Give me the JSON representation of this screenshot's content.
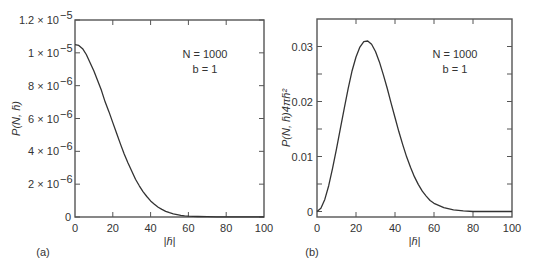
{
  "chart_data": [
    {
      "type": "line",
      "panel_label": "(a)",
      "title": "",
      "xlabel": "|h̄|",
      "ylabel": "P(N, h̄)",
      "xlim": [
        0,
        100
      ],
      "ylim": [
        0,
        1.2e-05
      ],
      "x_ticks": [
        0,
        20,
        40,
        60,
        80,
        100
      ],
      "x_tick_labels": [
        "0",
        "20",
        "40",
        "60",
        "80",
        "100"
      ],
      "y_ticks": [
        0,
        2e-06,
        4e-06,
        6e-06,
        8e-06,
        1e-05,
        1.2e-05
      ],
      "y_tick_labels": [
        "0",
        "2 × 10",
        "4 × 10",
        "6 × 10",
        "8 × 10",
        "1 × 10",
        "1.2 × 10"
      ],
      "y_tick_exponents": [
        "",
        "−6",
        "−6",
        "−6",
        "−6",
        "−5",
        "−5"
      ],
      "grid": false,
      "annotations": [
        "N = 1000",
        "b = 1"
      ],
      "series": [
        {
          "name": "P(N,h)",
          "x": [
            0,
            2,
            4,
            6,
            8,
            10,
            12,
            14,
            16,
            18,
            20,
            22,
            24,
            26,
            28,
            30,
            32,
            34,
            36,
            38,
            40,
            42,
            44,
            46,
            48,
            50,
            52,
            54,
            56,
            58,
            60,
            65,
            70,
            75,
            80,
            85,
            90,
            95,
            100
          ],
          "values": [
            1.05e-05,
            1.045e-05,
            1.025e-05,
            9.9e-06,
            9.4e-06,
            8.9e-06,
            8.3e-06,
            7.7e-06,
            7e-06,
            6.4e-06,
            5.75e-06,
            5.1e-06,
            4.45e-06,
            3.85e-06,
            3.3e-06,
            2.8e-06,
            2.3e-06,
            1.9e-06,
            1.55e-06,
            1.25e-06,
            9.8e-07,
            7.8e-07,
            6e-07,
            4.6e-07,
            3.5e-07,
            2.6e-07,
            1.9e-07,
            1.4e-07,
            1e-07,
            7e-08,
            5e-08,
            3e-08,
            2e-08,
            1e-08,
            1e-08,
            1e-08,
            1e-08,
            1e-08,
            1e-08
          ]
        }
      ]
    },
    {
      "type": "line",
      "panel_label": "(b)",
      "title": "",
      "xlabel": "|h̄|",
      "ylabel": "P(N, h̄)4πh̄²",
      "xlim": [
        0,
        100
      ],
      "ylim": [
        -0.001,
        0.035
      ],
      "x_ticks": [
        0,
        20,
        40,
        60,
        80,
        100
      ],
      "x_tick_labels": [
        "0",
        "20",
        "40",
        "60",
        "80",
        "100"
      ],
      "y_ticks": [
        0,
        0.01,
        0.02,
        0.03
      ],
      "y_tick_labels": [
        "0",
        "0.01",
        "0.02",
        "0.03"
      ],
      "grid": false,
      "annotations": [
        "N = 1000",
        "b = 1"
      ],
      "series": [
        {
          "name": "P(N,h)4πh²",
          "x": [
            0,
            2,
            4,
            6,
            8,
            10,
            12,
            14,
            16,
            18,
            20,
            22,
            24,
            26,
            28,
            30,
            32,
            34,
            36,
            38,
            40,
            42,
            44,
            46,
            48,
            50,
            52,
            54,
            56,
            58,
            60,
            65,
            70,
            75,
            80,
            85,
            90,
            95,
            100
          ],
          "values": [
            0.0,
            0.0006,
            0.0022,
            0.0047,
            0.0079,
            0.0114,
            0.0151,
            0.0188,
            0.0224,
            0.0256,
            0.0281,
            0.0299,
            0.0309,
            0.031,
            0.0304,
            0.0291,
            0.0272,
            0.0249,
            0.0224,
            0.0197,
            0.0171,
            0.0145,
            0.0121,
            0.0099,
            0.008,
            0.0063,
            0.0049,
            0.0037,
            0.0028,
            0.002,
            0.0015,
            0.0007,
            0.0003,
            0.0001,
            0.0,
            0.0,
            0.0,
            0.0,
            0.0
          ]
        }
      ]
    }
  ],
  "labels": {
    "panel_a": "(a)",
    "panel_b": "(b)",
    "annot_n": "N = 1000",
    "annot_b": "b = 1",
    "xlabel": "|h̄|",
    "ylabel_a": "P(N, h̄)",
    "ylabel_b": "P(N, h̄)4πh̄²"
  },
  "colors": {
    "axis": "#555555",
    "line": "#333333",
    "text": "#333333"
  }
}
